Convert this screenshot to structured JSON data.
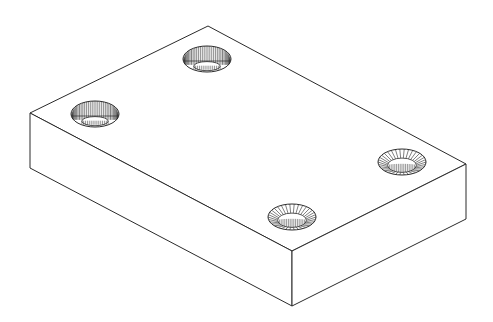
{
  "figure": {
    "stroke_color": "#2a2a2a",
    "background": "#ffffff"
  },
  "plate": {
    "top_back": [
      208,
      26
    ],
    "top_left": [
      30,
      113
    ],
    "top_front": [
      292,
      251
    ],
    "top_right": [
      466,
      164
    ],
    "bottom_left": [
      30,
      168
    ],
    "bottom_front": [
      292,
      306
    ],
    "bottom_right": [
      466,
      219
    ]
  },
  "holes": [
    {
      "name": "hole-back",
      "cx": 207,
      "cy": 59,
      "rx": 24,
      "ry": 13,
      "style": "counterbore"
    },
    {
      "name": "hole-left",
      "cx": 95,
      "cy": 114,
      "rx": 24,
      "ry": 13,
      "style": "counterbore"
    },
    {
      "name": "hole-right",
      "cx": 402,
      "cy": 162,
      "rx": 24,
      "ry": 13,
      "style": "countersink"
    },
    {
      "name": "hole-front",
      "cx": 292,
      "cy": 217,
      "rx": 24,
      "ry": 13,
      "style": "countersink"
    }
  ]
}
